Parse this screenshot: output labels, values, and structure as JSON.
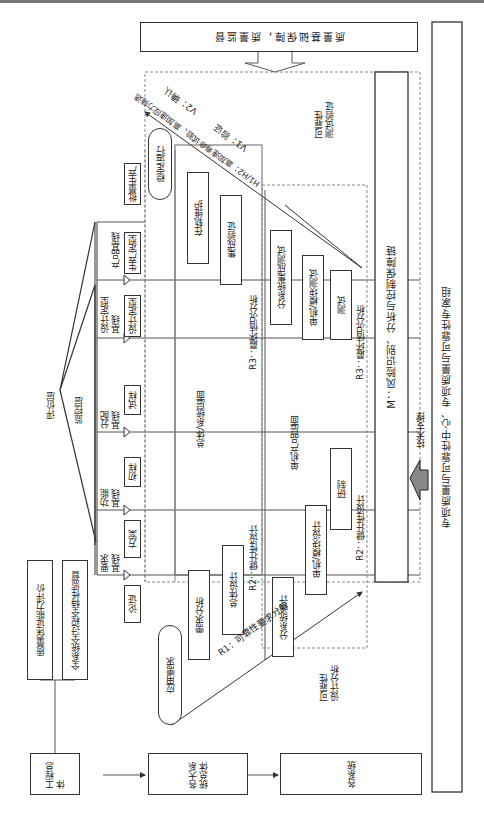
{
  "top_box": "质量基础保障，质量监督",
  "right_box": "专项质量与可靠性中心、专项质量与可靠性专家组",
  "tech_support": "技术支撑",
  "m_bar": "M：风险识别、分析与控制保障链",
  "test_verify": "可靠性\n测试验证",
  "design_analysis": "可靠性\n设计分析",
  "left": {
    "engineering": "工程总体",
    "major_systems": "各大系统总体",
    "systems": "各系统",
    "quality_eval": "质量保证能力评价",
    "full_supervision": "全系统全过程全特性监督",
    "eval_layer": "评价层",
    "monitor_layer": "监控层"
  },
  "baselines": [
    {
      "label": "要求基线"
    },
    {
      "label": "功能基线"
    },
    {
      "label": "分配基线"
    },
    {
      "label": "设计定型基线"
    },
    {
      "label": "产品基线"
    }
  ],
  "phases": [
    "论证",
    "方案",
    "初样",
    "试样",
    "设计定型",
    "生产定型",
    "批量生产"
  ],
  "clouds": {
    "need": "应用需求",
    "stable": "稳定运行"
  },
  "system_level": {
    "title": "总体/系统层面",
    "boxes": [
      "需求分析",
      "总体设计",
      "集成验证",
      "在轨维护"
    ]
  },
  "unit_level": {
    "title": "单机产品层面",
    "boxes": [
      "分系统设计",
      "单机/模块设计",
      "研制",
      "测试",
      "单机/模块测试",
      "分系统集成测试"
    ]
  },
  "arrows": {
    "r1": "R1：可靠性要求分解",
    "r2a": "R2：健壮性设计",
    "r2b": "R2：健壮性设计",
    "r3a": "R3：最坏情况分析",
    "r3b": "R3：最坏情况分析",
    "h1h2": "H1/H2：高加速寿命试验、高加速应力筛选",
    "v1": "V1：验证",
    "v2": "V2：确认"
  }
}
